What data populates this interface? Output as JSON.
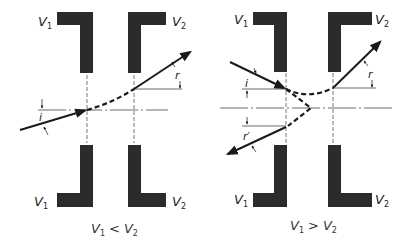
{
  "diagram": {
    "type": "electron optics - refraction of electron beam at electrostatic lens (two-cylinder/aperture electrodes)",
    "colors": {
      "electrode": "#2b2b2b",
      "line": "#1a1a1a",
      "background": "#ffffff"
    },
    "panels": [
      {
        "id": "left",
        "electrode_labels": {
          "top_left": "V",
          "top_left_sub": "1",
          "top_right": "V",
          "top_right_sub": "2",
          "bottom_left": "V",
          "bottom_left_sub": "1",
          "bottom_right": "V",
          "bottom_right_sub": "2"
        },
        "angle_labels": {
          "incident": "i",
          "refracted": "r"
        },
        "caption": {
          "a": "V",
          "a_sub": "1",
          "op": "<",
          "b": "V",
          "b_sub": "2"
        }
      },
      {
        "id": "right",
        "electrode_labels": {
          "top_left": "V",
          "top_left_sub": "1",
          "top_right": "V",
          "top_right_sub": "2",
          "bottom_left": "V",
          "bottom_left_sub": "1",
          "bottom_right": "V",
          "bottom_right_sub": "2"
        },
        "angle_labels": {
          "incident": "i",
          "refracted": "r",
          "reflected": "r′"
        },
        "caption": {
          "a": "V",
          "a_sub": "1",
          "op": ">",
          "b": "V",
          "b_sub": "2"
        }
      }
    ]
  }
}
